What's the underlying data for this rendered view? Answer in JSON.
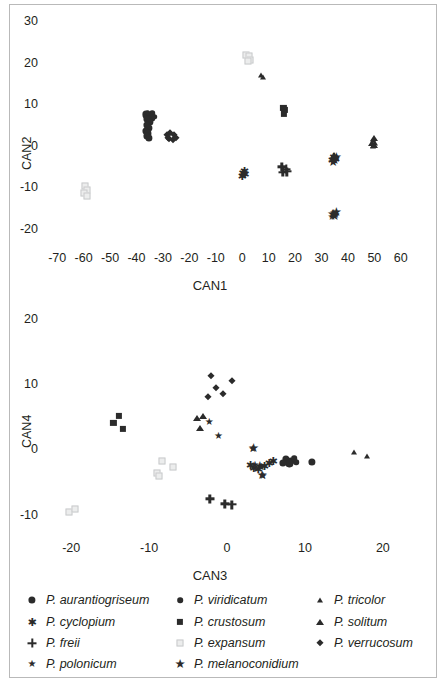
{
  "figure": {
    "panels": [
      {
        "id": "panel-can1-can2",
        "xlabel": "CAN1",
        "ylabel": "CAN2",
        "xticks": [
          -70,
          -60,
          -50,
          -40,
          -30,
          -20,
          -10,
          0,
          10,
          20,
          30,
          40,
          50,
          60
        ],
        "yticks": [
          30,
          20,
          10,
          0,
          -10,
          -20
        ],
        "xlim": [
          -75,
          65
        ],
        "ylim": [
          -23,
          32
        ]
      },
      {
        "id": "panel-can3-can4",
        "xlabel": "CAN3",
        "ylabel": "CAN4",
        "xticks": [
          -20,
          -10,
          0,
          10,
          20
        ],
        "yticks": [
          20,
          10,
          0,
          -10
        ],
        "xlim": [
          -23.5,
          24
        ],
        "ylim": [
          -12.5,
          21.5
        ]
      }
    ]
  },
  "legend": {
    "columns": [
      [
        {
          "label": "P. aurantiogriseum",
          "marker": "circle"
        },
        {
          "label": "P. cyclopium",
          "marker": "asterisk"
        },
        {
          "label": "P. freii",
          "marker": "plus"
        },
        {
          "label": "P. polonicum",
          "marker": "star"
        }
      ],
      [
        {
          "label": "P. viridicatum",
          "marker": "circle-small"
        },
        {
          "label": "P. crustosum",
          "marker": "square"
        },
        {
          "label": "P. expansum",
          "marker": "open-square"
        },
        {
          "label": "P. melanoconidium",
          "marker": "star-large"
        }
      ],
      [
        {
          "label": "P. tricolor",
          "marker": "triangle-small"
        },
        {
          "label": "P. solitum",
          "marker": "triangle"
        },
        {
          "label": "P. verrucosum",
          "marker": "diamond"
        }
      ]
    ]
  },
  "colors": {
    "marker_dark": "#2b2b2b",
    "marker_light": "#e3e4e6",
    "axis": "#555555",
    "frame": "#b9b9b9",
    "text": "#231f20"
  },
  "chart_data": [
    {
      "type": "scatter",
      "id": "panel-can1-can2",
      "title": "",
      "xlabel": "CAN1",
      "ylabel": "CAN2",
      "xlim": [
        -75,
        65
      ],
      "ylim": [
        -23,
        32
      ],
      "xticks": [
        -70,
        -60,
        -50,
        -40,
        -30,
        -20,
        -10,
        0,
        10,
        20,
        30,
        40,
        50,
        60
      ],
      "yticks": [
        30,
        20,
        10,
        0,
        -10,
        -20
      ],
      "grid": false,
      "legend_position": "below-figure",
      "series": [
        {
          "name": "P. aurantiogriseum",
          "marker": "circle",
          "points": [
            [
              -36.5,
              7.8
            ],
            [
              -35.2,
              7.4
            ],
            [
              -34.2,
              7.0
            ],
            [
              -36.0,
              6.6
            ],
            [
              -35.0,
              6.0
            ],
            [
              -36.2,
              5.2
            ],
            [
              -35.4,
              4.6
            ],
            [
              -36.3,
              3.8
            ],
            [
              -35.6,
              3.2
            ],
            [
              -36.0,
              2.6
            ],
            [
              -35.2,
              2.2
            ]
          ]
        },
        {
          "name": "P. viridicatum",
          "marker": "circle-small",
          "points": [
            [
              -34.0,
              8.0
            ],
            [
              -33.2,
              7.2
            ],
            [
              -35.8,
              8.2
            ]
          ]
        },
        {
          "name": "P. verrucosum",
          "marker": "diamond",
          "points": [
            [
              -28.5,
              2.8
            ],
            [
              -27.2,
              3.2
            ],
            [
              -26.0,
              2.8
            ],
            [
              -27.6,
              1.9
            ],
            [
              -26.3,
              1.6
            ],
            [
              -25.2,
              2.2
            ],
            [
              -28.0,
              2.0
            ]
          ]
        },
        {
          "name": "P. expansum",
          "marker": "open-square",
          "points": [
            [
              1.5,
              22.2
            ],
            [
              2.6,
              21.8
            ],
            [
              3.0,
              21.0
            ],
            [
              2.0,
              20.6
            ],
            [
              -59.5,
              -9.6
            ],
            [
              -58.6,
              -10.4
            ],
            [
              -59.8,
              -11.3
            ],
            [
              -58.8,
              -12.0
            ]
          ]
        },
        {
          "name": "P. tricolor",
          "marker": "triangle-small",
          "points": [
            [
              7.0,
              17.4
            ],
            [
              7.8,
              16.8
            ],
            [
              49.6,
              1.6
            ],
            [
              50.2,
              0.8
            ],
            [
              49.4,
              0.2
            ]
          ]
        },
        {
          "name": "P. crustosum",
          "marker": "square",
          "points": [
            [
              15.6,
              9.4
            ],
            [
              16.0,
              8.8
            ],
            [
              15.7,
              8.0
            ]
          ]
        },
        {
          "name": "P. solitum",
          "marker": "triangle",
          "points": [
            [
              49.8,
              2.0
            ],
            [
              49.2,
              1.0
            ],
            [
              50.0,
              0.4
            ],
            [
              34.8,
              -2.0
            ]
          ]
        },
        {
          "name": "P. melanoconidium",
          "marker": "star-large",
          "points": [
            [
              35.0,
              -3.2
            ],
            [
              34.4,
              -3.8
            ],
            [
              35.6,
              -2.6
            ],
            [
              34.2,
              -16.2
            ],
            [
              35.0,
              -16.8
            ],
            [
              35.6,
              -15.8
            ]
          ]
        },
        {
          "name": "P. cyclopium",
          "marker": "asterisk",
          "points": [
            [
              0.2,
              -6.4
            ],
            [
              1.0,
              -6.8
            ],
            [
              0.0,
              -7.2
            ],
            [
              0.8,
              -5.9
            ],
            [
              34.6,
              -2.6
            ],
            [
              35.2,
              -3.0
            ],
            [
              34.0,
              -3.4
            ]
          ]
        },
        {
          "name": "P. freii",
          "marker": "plus",
          "points": [
            [
              15.0,
              -4.9
            ],
            [
              16.6,
              -5.4
            ],
            [
              15.4,
              -6.2
            ],
            [
              16.8,
              -6.0
            ]
          ]
        },
        {
          "name": "P. polonicum",
          "marker": "star",
          "points": [
            [
              34.6,
              -16.0
            ],
            [
              35.4,
              -16.6
            ],
            [
              34.0,
              -16.9
            ]
          ]
        }
      ]
    },
    {
      "type": "scatter",
      "id": "panel-can3-can4",
      "title": "",
      "xlabel": "CAN3",
      "ylabel": "CAN4",
      "xlim": [
        -23.5,
        24
      ],
      "ylim": [
        -12.5,
        21.5
      ],
      "xticks": [
        -20,
        -10,
        0,
        10,
        20
      ],
      "yticks": [
        20,
        10,
        0,
        -10
      ],
      "grid": false,
      "legend_position": "below-figure",
      "series": [
        {
          "name": "P. verrucosum",
          "marker": "diamond",
          "points": [
            [
              -2.0,
              11.4
            ],
            [
              0.6,
              10.6
            ],
            [
              -1.4,
              9.5
            ],
            [
              -0.5,
              8.7
            ],
            [
              -2.4,
              8.1
            ]
          ]
        },
        {
          "name": "P. crustosum",
          "marker": "square",
          "points": [
            [
              -13.9,
              5.3
            ],
            [
              -14.6,
              4.2
            ],
            [
              -13.4,
              3.3
            ]
          ]
        },
        {
          "name": "P. solitum",
          "marker": "triangle",
          "points": [
            [
              -3.8,
              5.0
            ],
            [
              -3.1,
              5.3
            ],
            [
              -3.5,
              3.5
            ]
          ]
        },
        {
          "name": "P. polonicum",
          "marker": "star",
          "points": [
            [
              -2.3,
              4.4
            ],
            [
              -1.1,
              2.2
            ],
            [
              3.3,
              0.2
            ],
            [
              4.4,
              -2.6
            ],
            [
              4.6,
              -3.9
            ],
            [
              3.6,
              -2.3
            ]
          ]
        },
        {
          "name": "P. expansum",
          "marker": "open-square",
          "points": [
            [
              -8.3,
              -1.7
            ],
            [
              -7.0,
              -2.5
            ],
            [
              -9.0,
              -3.5
            ],
            [
              -8.7,
              -3.9
            ],
            [
              -20.3,
              -9.4
            ],
            [
              -19.5,
              -9.0
            ]
          ]
        },
        {
          "name": "P. cyclopium",
          "marker": "asterisk",
          "points": [
            [
              3.0,
              -2.3
            ],
            [
              3.4,
              -2.7
            ],
            [
              4.0,
              -2.9
            ],
            [
              4.8,
              -2.5
            ],
            [
              5.4,
              -2.0
            ],
            [
              5.9,
              -1.7
            ]
          ]
        },
        {
          "name": "P. melanoconidium",
          "marker": "star-large",
          "points": [
            [
              3.4,
              0.3
            ],
            [
              4.5,
              -3.8
            ],
            [
              4.2,
              -2.4
            ]
          ]
        },
        {
          "name": "P. aurantiogriseum",
          "marker": "circle",
          "points": [
            [
              7.6,
              -1.3
            ],
            [
              8.2,
              -1.6
            ],
            [
              8.0,
              -2.0
            ],
            [
              7.2,
              -1.9
            ],
            [
              10.9,
              -1.8
            ]
          ]
        },
        {
          "name": "P. viridicatum",
          "marker": "circle-small",
          "points": [
            [
              8.6,
              -1.2
            ],
            [
              8.9,
              -1.8
            ]
          ]
        },
        {
          "name": "P. tricolor",
          "marker": "triangle-small",
          "points": [
            [
              16.3,
              -0.3
            ],
            [
              18.0,
              -0.9
            ]
          ]
        },
        {
          "name": "P. freii",
          "marker": "plus",
          "points": [
            [
              -2.2,
              -7.4
            ],
            [
              -0.3,
              -8.2
            ],
            [
              0.6,
              -8.3
            ]
          ]
        }
      ]
    }
  ]
}
